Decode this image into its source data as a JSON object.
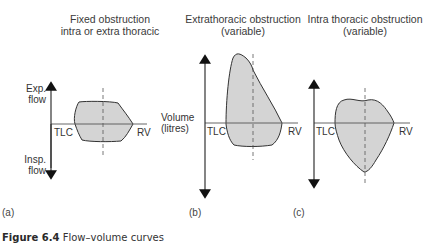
{
  "panels": [
    {
      "tag": "(a)",
      "title_line1": "Fixed obstruction",
      "title_line2": "intra or extra thoracic",
      "y_label_top_line1": "Exp.",
      "y_label_top_line2": "flow",
      "y_label_bottom_line1": "Insp.",
      "y_label_bottom_line2": "flow",
      "left_label": "TLC",
      "right_label": "RV"
    },
    {
      "tag": "(b)",
      "title_line1": "Extrathoracic obstruction",
      "title_line2": "(variable)",
      "x_label_line1": "Volume",
      "x_label_line2": "(litres)",
      "left_label": "TLC",
      "right_label": "RV"
    },
    {
      "tag": "(c)",
      "title_line1": "Intra thoracic obstruction",
      "title_line2": "(variable)",
      "left_label": "TLC",
      "right_label": "RV"
    }
  ],
  "caption": {
    "figure_label": "Figure 6.4",
    "text": " Flow–volume curves"
  },
  "colors": {
    "fill": "#d4d4d4",
    "stroke": "#333333",
    "axis": "#555555"
  }
}
